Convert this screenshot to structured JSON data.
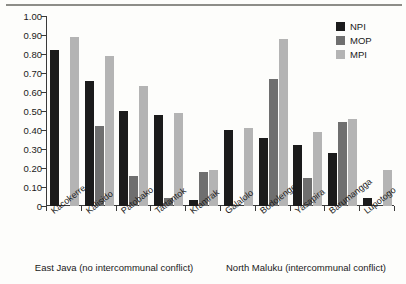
{
  "chart_data": {
    "type": "bar",
    "title": "",
    "xlabel": "",
    "ylabel": "",
    "ylim": [
      0,
      1.0
    ],
    "ytick_labels": [
      "1.00",
      "0.90",
      "0.80",
      "0.70",
      "0.60",
      "0.50",
      "0.40",
      "0.30",
      "0.20",
      "0.10",
      "0"
    ],
    "ytick_values": [
      1.0,
      0.9,
      0.8,
      0.7,
      0.6,
      0.5,
      0.4,
      0.3,
      0.2,
      0.1,
      0
    ],
    "grid": false,
    "legend_position": "top-right",
    "categories": [
      "Kacokerre",
      "Kalisido",
      "Patobako",
      "Tattantok",
      "Kramrak",
      "Galalolo",
      "Bodolenge",
      "Yasapira",
      "Barumangga",
      "Lupotogo"
    ],
    "series": [
      {
        "name": "NPI",
        "color": "#1b1b1b",
        "values": [
          0.82,
          0.66,
          0.5,
          0.48,
          0.03,
          0.4,
          0.36,
          0.32,
          0.28,
          0.04
        ]
      },
      {
        "name": "MOP",
        "color": "#6f6f6f",
        "values": [
          0.0,
          0.42,
          0.16,
          0.04,
          0.18,
          0.0,
          0.67,
          0.15,
          0.44,
          0.0
        ]
      },
      {
        "name": "MPI",
        "color": "#b4b4b4",
        "values": [
          0.89,
          0.79,
          0.63,
          0.49,
          0.19,
          0.41,
          0.88,
          0.39,
          0.46,
          0.19
        ]
      }
    ],
    "group_captions": [
      {
        "label": "East Java (no intercommunal conflict)",
        "categories": [
          "Kacokerre",
          "Kalisido",
          "Patobako",
          "Tattantok",
          "Kramrak"
        ]
      },
      {
        "label": "North Maluku (intercommunal conflict)",
        "categories": [
          "Galalolo",
          "Bodolenge",
          "Yasapira",
          "Barumangga",
          "Lupotogo"
        ]
      }
    ]
  },
  "legend": {
    "entries": [
      {
        "label": "NPI",
        "color": "#1b1b1b"
      },
      {
        "label": "MOP",
        "color": "#6f6f6f"
      },
      {
        "label": "MPI",
        "color": "#b4b4b4"
      }
    ]
  }
}
